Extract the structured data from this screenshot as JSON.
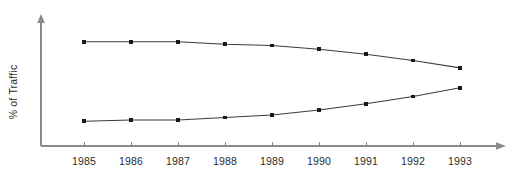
{
  "chart_data": {
    "type": "line",
    "title": "",
    "subtitle": "",
    "xlabel": "",
    "ylabel": "% of Traffic",
    "categories": [
      "1985",
      "1986",
      "1987",
      "1988",
      "1989",
      "1990",
      "1991",
      "1992",
      "1993"
    ],
    "x": [
      1985,
      1986,
      1987,
      1988,
      1989,
      1990,
      1991,
      1992,
      1993
    ],
    "grid": false,
    "legend": "none",
    "y_axis_ticks_visible": false,
    "y_axis_tick_labels": [],
    "xlim": [
      1984.6,
      1993.5
    ],
    "ylim": [
      0,
      100
    ],
    "series": [
      {
        "name": "upper-series",
        "marker": "square",
        "values": [
          84,
          84,
          84,
          82,
          81,
          78,
          74,
          69,
          63
        ]
      },
      {
        "name": "lower-series",
        "marker": "square",
        "values": [
          20,
          21,
          21,
          23,
          25,
          29,
          34,
          40,
          47
        ]
      }
    ],
    "annotations": []
  },
  "axes": {
    "y_axis_label": "% of Traffic",
    "x_axis_tick_labels": [
      "1985",
      "1986",
      "1987",
      "1988",
      "1989",
      "1990",
      "1991",
      "1992",
      "1993"
    ],
    "x_axis_arrow": "arrow-right",
    "y_axis_arrow": "arrow-up"
  },
  "colors": {
    "background": "#ffffff",
    "axis": "#8a8a8a",
    "series_line": "#3b3b3b",
    "marker": "#1a1a1a",
    "text": "#2b2b2b"
  }
}
